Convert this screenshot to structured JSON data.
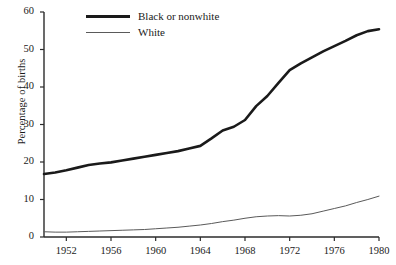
{
  "chart_data": {
    "type": "line",
    "title": "",
    "xlabel": "",
    "ylabel": "Percentage of births",
    "xlim": [
      1950,
      1980
    ],
    "ylim": [
      0,
      60
    ],
    "grid": false,
    "legend_position": "top-left",
    "xticks": [
      "1952",
      "1956",
      "1960",
      "1964",
      "1968",
      "1972",
      "1976",
      "1980"
    ],
    "yticks": [
      "0",
      "10",
      "20",
      "30",
      "40",
      "50",
      "60"
    ],
    "x": [
      1950,
      1951,
      1952,
      1953,
      1954,
      1955,
      1956,
      1957,
      1958,
      1959,
      1960,
      1961,
      1962,
      1963,
      1964,
      1965,
      1966,
      1967,
      1968,
      1969,
      1970,
      1971,
      1972,
      1973,
      1974,
      1975,
      1976,
      1977,
      1978,
      1979,
      1980
    ],
    "series": [
      {
        "name": "Black or nonwhite",
        "color": "#1a1a1a",
        "width": 2.6,
        "values": [
          16.8,
          17.2,
          17.8,
          18.5,
          19.2,
          19.6,
          19.9,
          20.4,
          20.9,
          21.4,
          21.9,
          22.4,
          22.9,
          23.6,
          24.3,
          26.3,
          28.4,
          29.4,
          31.2,
          34.9,
          37.6,
          41.1,
          44.5,
          46.3,
          47.9,
          49.5,
          50.9,
          52.3,
          53.8,
          54.9,
          55.4
        ]
      },
      {
        "name": "White",
        "color": "#5a5a5a",
        "width": 1.0,
        "values": [
          1.4,
          1.3,
          1.3,
          1.4,
          1.5,
          1.6,
          1.7,
          1.8,
          1.9,
          2.0,
          2.2,
          2.4,
          2.6,
          2.9,
          3.2,
          3.6,
          4.1,
          4.5,
          5.0,
          5.4,
          5.6,
          5.7,
          5.6,
          5.8,
          6.2,
          6.9,
          7.6,
          8.3,
          9.2,
          10.0,
          10.9
        ]
      }
    ]
  },
  "axis": {
    "y_title": "Percentage of births"
  },
  "legend": {
    "items": [
      {
        "label": "Black or nonwhite",
        "style": "thick"
      },
      {
        "label": "White",
        "style": "thin"
      }
    ]
  }
}
